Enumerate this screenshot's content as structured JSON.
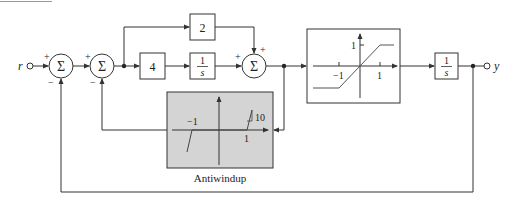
{
  "diagram": {
    "type": "block-diagram",
    "input": {
      "label": "r"
    },
    "output": {
      "label": "y"
    },
    "summing_junctions": [
      {
        "id": "sum1",
        "symbol": "Σ",
        "signs": {
          "left": "+",
          "bottom": "−"
        }
      },
      {
        "id": "sum2",
        "symbol": "Σ",
        "signs": {
          "left": "+",
          "bottom": "−"
        }
      },
      {
        "id": "sum3",
        "symbol": "Σ",
        "signs": {
          "left": "+",
          "top": "+"
        }
      }
    ],
    "blocks": {
      "proportional": {
        "label": "2"
      },
      "integral_gain": {
        "label": "4"
      },
      "integrator": {
        "num": "1",
        "den": "s"
      },
      "plant": {
        "num": "1",
        "den": "s"
      }
    },
    "saturation": {
      "ytick": "1",
      "xtick_neg": "−1",
      "xtick_pos": "1"
    },
    "antiwindup": {
      "caption": "Antiwindup",
      "xtick_neg": "−1",
      "xtick_pos": "1",
      "slope_label": "10",
      "fill": "#d4d4d4"
    },
    "colors": {
      "line": "#333333",
      "background": "#ffffff"
    }
  }
}
